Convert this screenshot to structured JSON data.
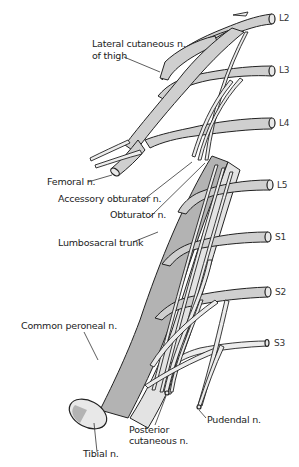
{
  "diagram": {
    "type": "anatomical",
    "colors": {
      "nerve_fill": "#cfcfcf",
      "nerve_dark": "#b3b3b3",
      "nerve_light": "#e3e3e3",
      "outline": "#222222",
      "background": "#ffffff"
    }
  },
  "roots": [
    {
      "id": "L2",
      "label": "L2"
    },
    {
      "id": "L3",
      "label": "L3"
    },
    {
      "id": "L4",
      "label": "L4"
    },
    {
      "id": "L5",
      "label": "L5"
    },
    {
      "id": "S1",
      "label": "S1"
    },
    {
      "id": "S2",
      "label": "S2"
    },
    {
      "id": "S3",
      "label": "S3"
    }
  ],
  "labels": {
    "lateral_cutaneous_line1": "Lateral cutaneous n.",
    "lateral_cutaneous_line2": "of thigh",
    "femoral": "Femoral n.",
    "accessory_obturator": "Accessory obturator n.",
    "obturator": "Obturator n.",
    "lumbosacral_trunk": "Lumbosacral trunk",
    "common_peroneal": "Common peroneal n.",
    "tibial": "Tibial n.",
    "posterior_cutaneous_line1": "Posterior",
    "posterior_cutaneous_line2": "cutaneous n.",
    "pudendal": "Pudendal n."
  }
}
